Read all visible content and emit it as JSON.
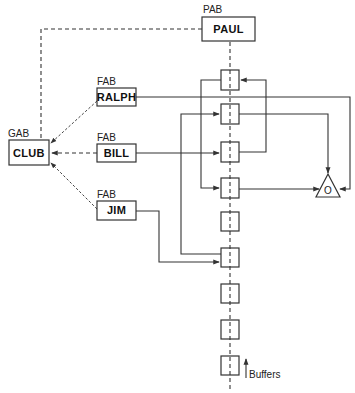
{
  "diagram": {
    "nodes": {
      "paul": {
        "type_label": "PAB",
        "name": "PAUL"
      },
      "club": {
        "type_label": "GAB",
        "name": "CLUB"
      },
      "ralph": {
        "type_label": "FAB",
        "name": "RALPH"
      },
      "bill": {
        "type_label": "FAB",
        "name": "BILL"
      },
      "jim": {
        "type_label": "FAB",
        "name": "JIM"
      }
    },
    "gate": {
      "symbol": "O"
    },
    "buffers": {
      "label": "Buffers",
      "count": 9
    },
    "colors": {
      "line": "#333333",
      "background": "#ffffff"
    }
  }
}
